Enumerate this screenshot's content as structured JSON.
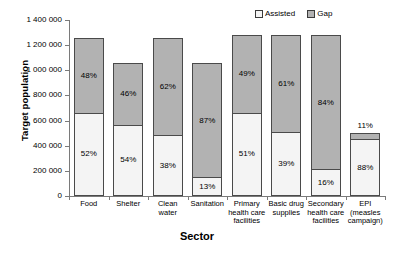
{
  "chart_data": {
    "type": "bar",
    "subtype": "stacked-vertical",
    "title": "",
    "xlabel": "Sector",
    "ylabel": "Target population",
    "ylim": [
      0,
      1400000
    ],
    "ytick_step": 200000,
    "ytick_labels": [
      "1 400 000",
      "1 200 000",
      "1 000 000",
      "800 000",
      "600 000",
      "400 000",
      "200 000",
      "0"
    ],
    "ytick_values": [
      1400000,
      1200000,
      1000000,
      800000,
      600000,
      400000,
      200000,
      0
    ],
    "grid": false,
    "legend_position": "top-right",
    "categories": [
      "Food",
      "Shelter",
      "Clean\nwater",
      "Sanitation",
      "Primary\nhealth care\nfacilities",
      "Basic drug\nsupplies",
      "Secondary\nhealth care\nfacilities",
      "EPI\n(measles\ncampaign)"
    ],
    "series": [
      {
        "name": "Assisted",
        "color": "#f4f4f4",
        "values": [
          655000,
          560000,
          475000,
          140000,
          655000,
          500000,
          205000,
          445000
        ],
        "labels": [
          "52%",
          "54%",
          "38%",
          "13%",
          "51%",
          "39%",
          "16%",
          "88%"
        ]
      },
      {
        "name": "Gap",
        "color": "#b2b2b2",
        "values": [
          605000,
          500000,
          785000,
          920000,
          625000,
          780000,
          1075000,
          55000
        ],
        "labels": [
          "48%",
          "46%",
          "62%",
          "87%",
          "49%",
          "61%",
          "84%",
          "11%"
        ]
      }
    ],
    "totals": [
      1260000,
      1060000,
      1260000,
      1060000,
      1280000,
      1280000,
      1280000,
      500000
    ]
  },
  "legend": {
    "entries": [
      {
        "label": "Assisted"
      },
      {
        "label": "Gap"
      }
    ]
  }
}
